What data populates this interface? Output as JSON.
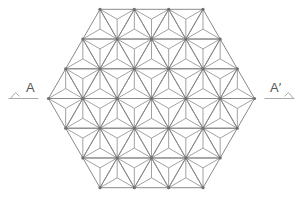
{
  "diagram": {
    "title": "",
    "pattern": "asanoha (hemp leaf) tiling inside regular hexagon",
    "hexagon": {
      "center_x": 151.5,
      "center_y": 98.5,
      "side": 103,
      "subdivisions_per_side": 3
    },
    "colors": {
      "line": "#8a8a8a",
      "node": "#6f6f6f",
      "label": "#555555",
      "background": "#ffffff"
    },
    "section_marks": [
      {
        "id": "left",
        "label": "A",
        "x": 10,
        "y": 110
      },
      {
        "id": "right",
        "label": "A′",
        "x": 270,
        "y": 110
      }
    ]
  }
}
